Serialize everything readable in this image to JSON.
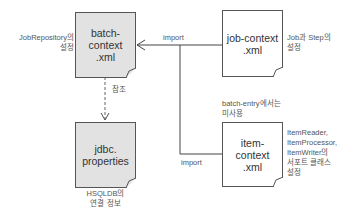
{
  "nodes": {
    "batch_context": {
      "label": "batch-\ncontext\n.xml",
      "fill": "#e2e2e2"
    },
    "job_context": {
      "label": "job-context\n.xml",
      "fill": "#ffffff"
    },
    "jdbc_properties": {
      "label": "jdbc.\nproperties",
      "fill": "#e2e2e2"
    },
    "item_context": {
      "label": "item-\ncontext\n.xml",
      "fill": "#ffffff"
    }
  },
  "annotations": {
    "batch_context_note": "JobRepository의\n설정",
    "job_context_note": "Job과 Step의\n설정",
    "jdbc_note": "HSQLDB의\n연결 정보",
    "item_context_note": "ItemReader,\nItemProcessor,\nItemWriter의\n서포트 클래스\n설정",
    "batch_entry_note": "batch-entry에서는\n미사용"
  },
  "edges": {
    "import_top": "import",
    "import_bottom": "import",
    "reference": "참조"
  }
}
